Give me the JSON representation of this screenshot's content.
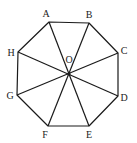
{
  "figure": {
    "stroke_color": "#1a1a1a",
    "vertices": [
      {
        "name": "A",
        "x": 49,
        "y": 22,
        "lx": 46,
        "ly": 17
      },
      {
        "name": "B",
        "x": 89,
        "y": 23,
        "lx": 89,
        "ly": 18
      },
      {
        "name": "C",
        "x": 118,
        "y": 53,
        "lx": 124,
        "ly": 54
      },
      {
        "name": "D",
        "x": 118,
        "y": 96,
        "lx": 124,
        "ly": 101
      },
      {
        "name": "E",
        "x": 89,
        "y": 126,
        "lx": 89,
        "ly": 138
      },
      {
        "name": "F",
        "x": 48,
        "y": 126,
        "lx": 45,
        "ly": 138
      },
      {
        "name": "G",
        "x": 17,
        "y": 95,
        "lx": 10,
        "ly": 99
      },
      {
        "name": "H",
        "x": 18,
        "y": 52,
        "lx": 11,
        "ly": 56
      }
    ],
    "center": {
      "name": "O",
      "x": 69,
      "y": 74,
      "lx": 69,
      "ly": 63
    }
  }
}
